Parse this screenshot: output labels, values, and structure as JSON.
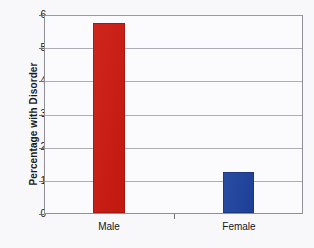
{
  "chart_data": {
    "type": "bar",
    "title": "",
    "xlabel": "",
    "ylabel": "Percentage with Disorder",
    "categories": [
      "Male",
      "Female"
    ],
    "values": [
      5.75,
      1.25
    ],
    "series": [
      {
        "name": "Percentage with Disorder",
        "values": [
          5.75,
          1.25
        ],
        "colors": [
          "#cc1a10",
          "#1f44a0"
        ]
      }
    ],
    "ylim": [
      0,
      6
    ],
    "ytick_labels": [
      "0",
      "1",
      "2",
      "3",
      "4",
      "5",
      "6"
    ],
    "ytick_values": [
      0,
      1,
      2,
      3,
      4,
      5,
      6
    ],
    "grid": true,
    "grid_axis": "y",
    "legend": false,
    "legend_position": "none",
    "annotations": []
  },
  "colors": {
    "bar_male": "#cc1a10",
    "bar_female": "#1f44a0",
    "gridline": "#adadb6",
    "axis": "#8f8f98",
    "plot_background": "#fbfbfd",
    "figure_background": "#f8f8fa",
    "text": "#15151c"
  }
}
